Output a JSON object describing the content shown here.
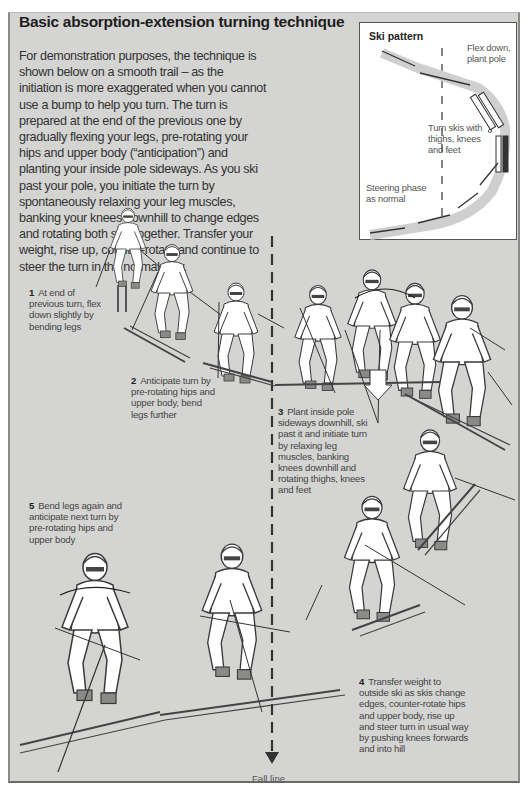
{
  "header": {
    "title": "Basic absorption-extension turning technique"
  },
  "intro": {
    "text": "For demonstration purposes, the technique is shown below on a smooth trail – as the initiation is more exaggerated when you cannot use a bump to help you turn. The turn is prepared at the end of the previous one by gradually flexing your legs, pre-rotating your hips and upper body (“anticipation”) and planting your inside pole sideways. As you ski past your pole, you initiate the turn by spontaneously relaxing your leg muscles, banking your knees downhill to change edges and rotating both skis together. Transfer your weight, rise up, counter-rotate and continue to steer the turn in the normal way."
  },
  "ski_pattern": {
    "title": "Ski pattern",
    "labels": [
      "Flex down, plant pole",
      "Turn skis with thighs, knees and feet",
      "Steering phase as normal"
    ]
  },
  "steps": [
    {
      "number": "1",
      "text": "At end of previous turn, flex down slightly by bending legs"
    },
    {
      "number": "2",
      "text": "Anticipate turn by pre-rotating hips and upper body, bend legs further"
    },
    {
      "number": "3",
      "text": "Plant inside pole sideways downhill, ski past it and initiate turn by relaxing leg muscles, banking knees downhill and rotating thighs, knees and feet"
    },
    {
      "number": "4",
      "text": "Transfer weight to outside ski as skis change edges, counter-rotate hips and upper body, rise up and steer turn in usual way by pushing knees forwards and into hill"
    },
    {
      "number": "5",
      "text": "Bend legs again and anticipate next turn by pre-rotating hips and upper body"
    }
  ],
  "fall_line": {
    "label": "Fall line"
  },
  "icons": {
    "fall-line-arrow": "down-arrow",
    "pressure-arrow": "hollow-down-arrow",
    "rotation-arrow": "curved-arrow"
  },
  "colors": {
    "page_background": "#d4d4d2",
    "pattern_box_background": "#ffffff",
    "text": "#2a2a2a",
    "figure_fill": "#ffffff",
    "figure_outline": "#3a3a3a"
  }
}
